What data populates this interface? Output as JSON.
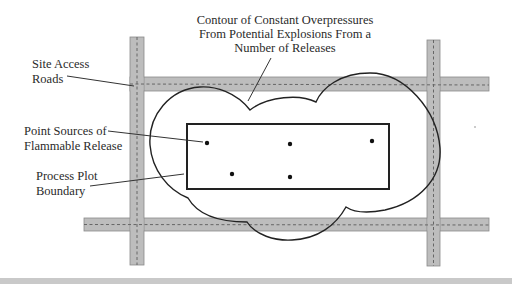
{
  "diagram": {
    "title_lines": [
      "Contour of Constant Overpressures",
      "From Potential Explosions From a",
      "Number of Releases"
    ],
    "labels": {
      "roads": [
        "Site Access",
        "Roads"
      ],
      "sources": [
        "Point Sources of",
        "Flammable Release"
      ],
      "plot": [
        "Process Plot",
        "Boundary"
      ]
    },
    "colors": {
      "road_fill": "#bdbdbd",
      "road_centerline": "#666666",
      "line": "#222222",
      "background": "#ffffff"
    },
    "point_sources": [
      {
        "x": 207,
        "y": 143
      },
      {
        "x": 290,
        "y": 144
      },
      {
        "x": 372,
        "y": 141
      },
      {
        "x": 232,
        "y": 174
      },
      {
        "x": 290,
        "y": 177
      }
    ]
  }
}
